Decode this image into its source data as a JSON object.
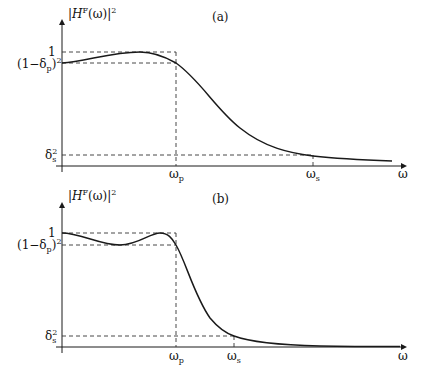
{
  "panels": [
    {
      "id": "a",
      "tag": "(a)",
      "ylabel": {
        "pre": "|",
        "H": "H",
        "sup": "F",
        "arg": "(ω)|",
        "pow": "2"
      },
      "ytick_one": "1",
      "ytick_passband": {
        "main": "(1−δ",
        "sub": "p",
        "close": ")",
        "pow": "2"
      },
      "ytick_stopband": {
        "main": "δ",
        "sub": "s",
        "pow": "2"
      },
      "xtick_wp": {
        "main": "ω",
        "sub": "p"
      },
      "xtick_ws": {
        "main": "ω",
        "sub": "s"
      },
      "xlabel": "ω",
      "response_type": "Chebyshev-like (monotonic stopband, one passband peak)"
    },
    {
      "id": "b",
      "tag": "(b)",
      "ylabel": {
        "pre": "|",
        "H": "H",
        "sup": "F",
        "arg": "(ω)|",
        "pow": "2"
      },
      "ytick_one": "1",
      "ytick_passband": {
        "main": "(1−δ",
        "sub": "p",
        "close": ")",
        "pow": "2"
      },
      "ytick_stopband": {
        "main": "δ",
        "sub": "s",
        "pow": "2"
      },
      "xtick_wp": {
        "main": "ω",
        "sub": "p"
      },
      "xtick_ws": {
        "main": "ω",
        "sub": "s"
      },
      "xlabel": "ω",
      "response_type": "Equiripple passband, sharp transition"
    }
  ],
  "colors": {
    "ink": "#1a1a1a",
    "dash": "#333333",
    "background": "#ffffff"
  }
}
